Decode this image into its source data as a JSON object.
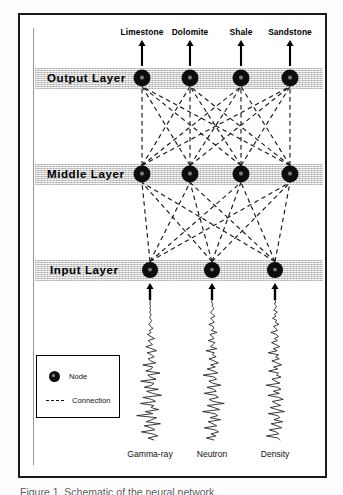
{
  "figure": {
    "caption": "Figure 1. Schematic of the neural network."
  },
  "legend": {
    "node_label": "Node",
    "connection_label": "Connection"
  },
  "layers": [
    {
      "id": "output",
      "label": "Output Layer",
      "node_count": 4,
      "y": 78
    },
    {
      "id": "middle",
      "label": "Middle Layer",
      "node_count": 4,
      "y": 174
    },
    {
      "id": "input",
      "label": "Input Layer",
      "node_count": 3,
      "y": 270
    }
  ],
  "outputs": [
    {
      "label": "Limestone",
      "x": 142
    },
    {
      "label": "Dolomite",
      "x": 190
    },
    {
      "label": "Shale",
      "x": 241
    },
    {
      "label": "Sandstone",
      "x": 290
    }
  ],
  "inputs": [
    {
      "label": "Gamma-ray",
      "x": 150
    },
    {
      "label": "Neutron",
      "x": 212
    },
    {
      "label": "Density",
      "x": 275
    }
  ],
  "colors": {
    "node": "#0d0d0d",
    "connection": "#1a1a1a",
    "band": "#dcdcdc",
    "frame": "#1a1a1a",
    "log_curve": "#1a1a1a"
  },
  "chart_data": {
    "type": "diagram",
    "node_positions": {
      "output": [
        142,
        190,
        241,
        290
      ],
      "middle": [
        142,
        190,
        241,
        290
      ],
      "input": [
        150,
        212,
        275
      ]
    },
    "layer_y": {
      "output": 78,
      "middle": 174,
      "input": 270
    },
    "node_radius": 8.5,
    "connections_fully_connected": true,
    "well_logs": [
      {
        "name": "Gamma-ray",
        "center_x": 150,
        "top_y": 300,
        "bottom_y": 440,
        "amplitude": [
          0,
          1,
          -1,
          2,
          0,
          3,
          -2,
          4,
          1,
          -1,
          5,
          2,
          -3,
          1,
          8,
          -2,
          3,
          -6,
          2,
          10,
          -4,
          1,
          5,
          -8,
          3,
          12,
          -5,
          2,
          7,
          -3,
          1,
          9,
          -11,
          4,
          2,
          -6,
          14,
          -3,
          1,
          8,
          -12,
          5,
          2,
          -7,
          10,
          -4,
          3,
          13,
          -8,
          2,
          6,
          -10,
          4,
          1,
          9,
          -5,
          3,
          -14,
          7,
          2,
          -4,
          11,
          -6,
          1,
          5,
          -9,
          3,
          8,
          -2,
          4
        ]
      },
      {
        "name": "Neutron",
        "center_x": 212,
        "top_y": 300,
        "bottom_y": 440,
        "amplitude": [
          2,
          -3,
          5,
          -1,
          8,
          3,
          -6,
          2,
          10,
          -4,
          1,
          7,
          -9,
          3,
          5,
          -2,
          12,
          -5,
          1,
          4,
          -8,
          6,
          2,
          -3,
          9,
          -11,
          4,
          1,
          7,
          -5,
          3,
          10,
          -2,
          5,
          -7,
          2,
          8,
          -12,
          3,
          6,
          -4,
          1,
          11,
          -6,
          2,
          5,
          -9,
          4,
          7,
          -3,
          1,
          13,
          -5,
          2,
          8,
          -10,
          3,
          6,
          -2,
          9,
          -4,
          1,
          5,
          -8,
          3,
          7,
          -1,
          4,
          -6,
          2
        ]
      },
      {
        "name": "Density",
        "center_x": 275,
        "top_y": 300,
        "bottom_y": 440,
        "amplitude": [
          -1,
          4,
          -3,
          7,
          2,
          -5,
          9,
          -2,
          3,
          -8,
          5,
          1,
          11,
          -4,
          2,
          6,
          -10,
          3,
          8,
          -1,
          5,
          -7,
          2,
          9,
          -3,
          4,
          -12,
          6,
          1,
          7,
          -5,
          3,
          10,
          -2,
          4,
          -9,
          5,
          2,
          8,
          -4,
          1,
          6,
          -11,
          3,
          7,
          -2,
          5,
          -8,
          4,
          9,
          -3,
          1,
          6,
          -5,
          2,
          10,
          -7,
          3,
          5,
          -1,
          8,
          -4,
          2,
          7,
          -6,
          1,
          4,
          -9,
          3,
          5
        ]
      }
    ]
  }
}
